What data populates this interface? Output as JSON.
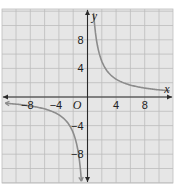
{
  "chart_data": {
    "type": "line",
    "title": "",
    "function": "y = 10/x",
    "xlabel": "x",
    "ylabel": "y",
    "origin_label": "O",
    "xlim": [
      -12,
      12
    ],
    "ylim": [
      -12,
      12
    ],
    "grid": true,
    "grid_step": 2,
    "x_ticks": [
      {
        "value": -8,
        "label": "−8"
      },
      {
        "value": -4,
        "label": "−4"
      },
      {
        "value": 4,
        "label": "4"
      },
      {
        "value": 8,
        "label": "8"
      }
    ],
    "y_ticks": [
      {
        "value": 8,
        "label": "8"
      },
      {
        "value": 4,
        "label": "4"
      },
      {
        "value": -4,
        "label": "−4"
      },
      {
        "value": -8,
        "label": "−8"
      }
    ],
    "series": [
      {
        "name": "branch-positive",
        "x": [
          0.85,
          1,
          1.5,
          2,
          3,
          4,
          5,
          6,
          8,
          10,
          11.5
        ],
        "y": [
          11.76,
          10,
          6.67,
          5,
          3.33,
          2.5,
          2,
          1.67,
          1.25,
          1,
          0.87
        ]
      },
      {
        "name": "branch-negative",
        "x": [
          -11.5,
          -10,
          -8,
          -6,
          -5,
          -4,
          -3,
          -2,
          -1.5,
          -1,
          -0.85
        ],
        "y": [
          -0.87,
          -1,
          -1.25,
          -1.67,
          -2,
          -2.5,
          -3.33,
          -5,
          -6.67,
          -10,
          -11.76
        ]
      }
    ],
    "colors": {
      "background": "#e6e6e6",
      "grid": "#bdbdbd",
      "axis": "#2a2a2a",
      "curve": "#8c8c8c"
    }
  }
}
